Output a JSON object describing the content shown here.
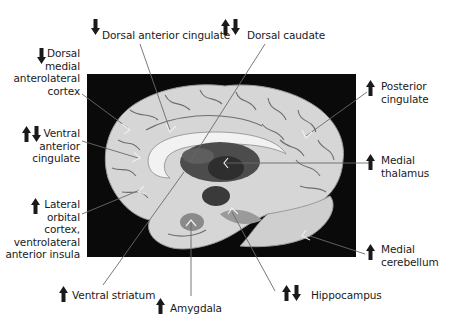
{
  "diagram": {
    "type": "annotated-brain-medial-sagittal",
    "legend": {
      "up": "increased",
      "down": "decreased"
    },
    "colors": {
      "panel": "#0a0a0a",
      "brain": "#d9d9d9",
      "sulci": "#6a6a6a",
      "deep": "#4a4a4a",
      "text": "#1a1a1a",
      "leader": "#666666"
    },
    "labels": [
      {
        "id": "dorsal-anterior-cingulate",
        "text": "Dorsal anterior cingulate",
        "arrows": [
          "down"
        ]
      },
      {
        "id": "dorsal-caudate",
        "text": "Dorsal caudate",
        "arrows": [
          "up",
          "down"
        ]
      },
      {
        "id": "dorsal-medial-anterolateral-cortex",
        "lines": [
          "Dorsal",
          "medial",
          "anterolateral",
          "cortex"
        ],
        "arrows": [
          "down"
        ]
      },
      {
        "id": "posterior-cingulate",
        "lines": [
          "Posterior",
          "cingulate"
        ],
        "arrows": [
          "up"
        ]
      },
      {
        "id": "ventral-anterior-cingulate",
        "lines": [
          "Ventral",
          "anterior",
          "cingulate"
        ],
        "arrows": [
          "up",
          "down"
        ]
      },
      {
        "id": "medial-thalamus",
        "lines": [
          "Medial",
          "thalamus"
        ],
        "arrows": [
          "up"
        ]
      },
      {
        "id": "lateral-orbital-cortex",
        "lines": [
          "Lateral",
          "orbital",
          "cortex,",
          "ventrolateral",
          "anterior insula"
        ],
        "arrows": [
          "up"
        ]
      },
      {
        "id": "medial-cerebellum",
        "lines": [
          "Medial",
          "cerebellum"
        ],
        "arrows": [
          "up"
        ]
      },
      {
        "id": "ventral-striatum",
        "text": "Ventral striatum",
        "arrows": [
          "up"
        ]
      },
      {
        "id": "amygdala",
        "text": "Amygdala",
        "arrows": [
          "up"
        ]
      },
      {
        "id": "hippocampus",
        "text": "Hippocampus",
        "arrows": [
          "up",
          "down"
        ]
      }
    ]
  }
}
